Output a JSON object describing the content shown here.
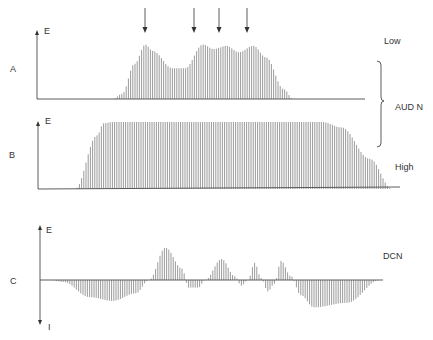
{
  "figure": {
    "arrows_count": 4,
    "panels": [
      {
        "id": "A",
        "label": "A",
        "y_axis_label": "E",
        "side_label": "Low",
        "profile": [
          [
            0,
            0
          ],
          [
            0.05,
            0.08
          ],
          [
            0.12,
            0.55
          ],
          [
            0.18,
            0.85
          ],
          [
            0.22,
            0.75
          ],
          [
            0.33,
            0.48
          ],
          [
            0.4,
            0.48
          ],
          [
            0.5,
            0.85
          ],
          [
            0.56,
            0.78
          ],
          [
            0.63,
            0.83
          ],
          [
            0.7,
            0.73
          ],
          [
            0.78,
            0.83
          ],
          [
            0.85,
            0.65
          ],
          [
            0.95,
            0.15
          ],
          [
            1,
            0
          ]
        ]
      },
      {
        "id": "B",
        "label": "B",
        "y_axis_label": "E",
        "side_label": "High",
        "profile": [
          [
            0,
            0
          ],
          [
            0.07,
            0.8
          ],
          [
            0.09,
            0.98
          ],
          [
            0.12,
            1
          ],
          [
            0.78,
            1
          ],
          [
            0.84,
            0.92
          ],
          [
            0.93,
            0.45
          ],
          [
            1,
            0
          ]
        ]
      },
      {
        "id": "C",
        "label": "C",
        "y_axis_label_top": "E",
        "y_axis_label_bottom": "I",
        "side_label": "DCN",
        "profile": [
          [
            0,
            0
          ],
          [
            0.04,
            -0.05
          ],
          [
            0.12,
            -0.45
          ],
          [
            0.19,
            -0.55
          ],
          [
            0.26,
            -0.35
          ],
          [
            0.3,
            0
          ],
          [
            0.35,
            0.85
          ],
          [
            0.4,
            0.3
          ],
          [
            0.42,
            -0.2
          ],
          [
            0.45,
            -0.2
          ],
          [
            0.47,
            0
          ],
          [
            0.52,
            0.55
          ],
          [
            0.56,
            0.1
          ],
          [
            0.58,
            -0.15
          ],
          [
            0.6,
            0
          ],
          [
            0.62,
            0.45
          ],
          [
            0.64,
            0.05
          ],
          [
            0.66,
            -0.3
          ],
          [
            0.68,
            -0.1
          ],
          [
            0.7,
            0.5
          ],
          [
            0.73,
            0.1
          ],
          [
            0.76,
            -0.4
          ],
          [
            0.8,
            -0.72
          ],
          [
            0.9,
            -0.6
          ],
          [
            1,
            0
          ]
        ]
      }
    ],
    "brace_label": "AUD N"
  }
}
